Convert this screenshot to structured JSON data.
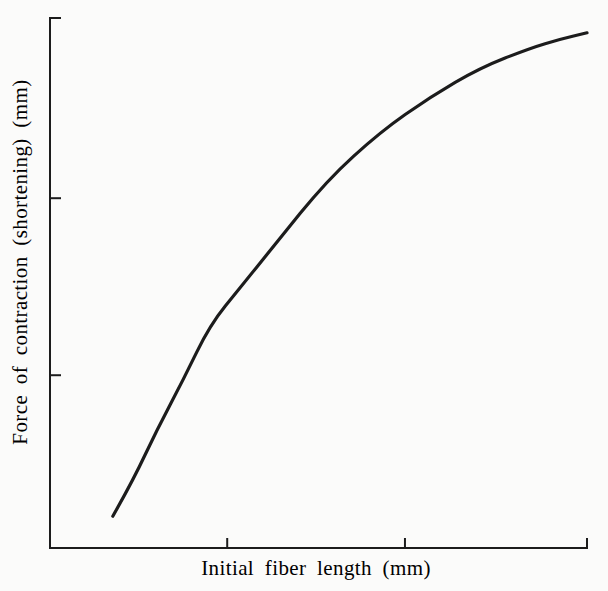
{
  "figure": {
    "background_color": "#fbfbfa",
    "ink_color": "#1c1c1c"
  },
  "chart_data": {
    "type": "line",
    "title": "",
    "xlabel": "Initial fiber length (mm)",
    "ylabel": "Force of contraction (shortening) (mm)",
    "x_tick_labels": [],
    "y_tick_labels": [],
    "legend": "none",
    "grid": false,
    "xlim_norm": [
      0,
      1
    ],
    "ylim_norm": [
      0,
      1
    ],
    "x_ticks_norm": [
      0.33,
      0.661,
      1.0
    ],
    "y_ticks_norm": [
      0.326,
      0.66,
      1.0
    ],
    "series": [
      {
        "name": "force-vs-initial-fiber-length",
        "points_norm": [
          [
            0.117,
            0.06
          ],
          [
            0.155,
            0.128
          ],
          [
            0.199,
            0.223
          ],
          [
            0.248,
            0.317
          ],
          [
            0.298,
            0.421
          ],
          [
            0.354,
            0.491
          ],
          [
            0.415,
            0.568
          ],
          [
            0.516,
            0.694
          ],
          [
            0.615,
            0.785
          ],
          [
            0.708,
            0.851
          ],
          [
            0.801,
            0.906
          ],
          [
            0.894,
            0.943
          ],
          [
            0.95,
            0.96
          ],
          [
            1.0,
            0.972
          ]
        ]
      }
    ]
  }
}
